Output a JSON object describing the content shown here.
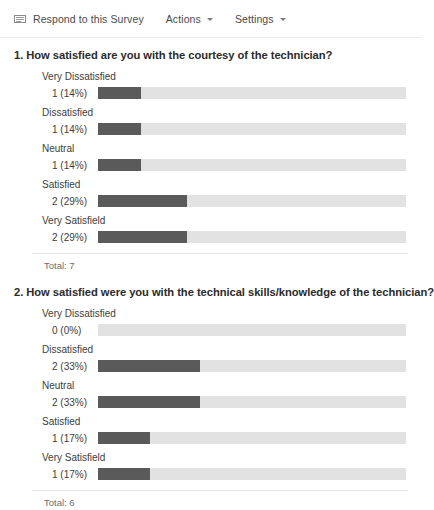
{
  "toolbar": {
    "respond_label": "Respond to this Survey",
    "respond_icon": "form-icon",
    "actions_label": "Actions",
    "settings_label": "Settings",
    "caret_icon": "chevron-down-icon"
  },
  "colors": {
    "fill": "#5a5a5a",
    "track": "#e2e2e2",
    "text": "#3d3d3d"
  },
  "chart_data": {
    "type": "bar",
    "charts": [
      {
        "title": "1. How satisfied are you with the courtesy of the technician?",
        "categories": [
          "Very Dissatisfied",
          "Dissatisfied",
          "Neutral",
          "Satisfied",
          "Very Satisfield"
        ],
        "values": [
          1,
          1,
          1,
          2,
          2
        ],
        "percents": [
          14,
          14,
          14,
          29,
          29
        ],
        "labels": [
          "1 (14%)",
          "1 (14%)",
          "1 (14%)",
          "2 (29%)",
          "2 (29%)"
        ],
        "total_label": "Total: 7",
        "total": 7,
        "xlabel": "",
        "ylabel": "",
        "xlim": [
          0,
          100
        ],
        "grid": false,
        "legend": "none"
      },
      {
        "title": "2. How satisfied were you with the technical skills/knowledge of the technician?",
        "categories": [
          "Very Dissatisfied",
          "Dissatisfied",
          "Neutral",
          "Satisfied",
          "Very Satisfield"
        ],
        "values": [
          0,
          2,
          2,
          1,
          1
        ],
        "percents": [
          0,
          33,
          33,
          17,
          17
        ],
        "labels": [
          "0 (0%)",
          "2 (33%)",
          "2 (33%)",
          "1 (17%)",
          "1 (17%)"
        ],
        "total_label": "Total: 6",
        "total": 6,
        "xlabel": "",
        "ylabel": "",
        "xlim": [
          0,
          100
        ],
        "grid": false,
        "legend": "none"
      }
    ]
  }
}
